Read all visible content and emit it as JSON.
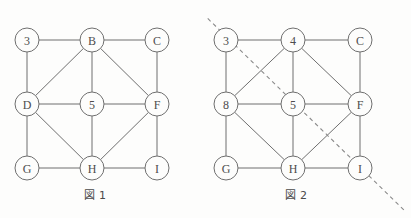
{
  "document": {
    "title": "Two isomorphic 3x3 grid graphs with diagonals",
    "background_color": "#fdfdfc",
    "line_color": "#6f6f6f",
    "label_color": "#4d4d4d",
    "dash_color": "#8a8a8a"
  },
  "figures": [
    {
      "id": "figure-1",
      "caption": "図 1",
      "geometry": {
        "columns_x": [
          27,
          92,
          157
        ],
        "rows_y": [
          40,
          104,
          168
        ],
        "node_radius": 12
      },
      "nodes": [
        {
          "id": "n1",
          "label": "3",
          "col": 0,
          "row": 0,
          "cx": 27,
          "cy": 40
        },
        {
          "id": "n2",
          "label": "B",
          "col": 1,
          "row": 0,
          "cx": 92,
          "cy": 40
        },
        {
          "id": "n3",
          "label": "C",
          "col": 2,
          "row": 0,
          "cx": 157,
          "cy": 40
        },
        {
          "id": "n4",
          "label": "D",
          "col": 0,
          "row": 1,
          "cx": 27,
          "cy": 104
        },
        {
          "id": "n5",
          "label": "5",
          "col": 1,
          "row": 1,
          "cx": 92,
          "cy": 104
        },
        {
          "id": "n6",
          "label": "F",
          "col": 2,
          "row": 1,
          "cx": 157,
          "cy": 104
        },
        {
          "id": "n7",
          "label": "G",
          "col": 0,
          "row": 2,
          "cx": 27,
          "cy": 168
        },
        {
          "id": "n8",
          "label": "H",
          "col": 1,
          "row": 2,
          "cx": 92,
          "cy": 168
        },
        {
          "id": "n9",
          "label": "I",
          "col": 2,
          "row": 2,
          "cx": 157,
          "cy": 168
        }
      ],
      "edges": [
        {
          "from": "n1",
          "to": "n2",
          "kind": "horizontal"
        },
        {
          "from": "n2",
          "to": "n3",
          "kind": "horizontal"
        },
        {
          "from": "n4",
          "to": "n5",
          "kind": "horizontal"
        },
        {
          "from": "n5",
          "to": "n6",
          "kind": "horizontal"
        },
        {
          "from": "n7",
          "to": "n8",
          "kind": "horizontal"
        },
        {
          "from": "n8",
          "to": "n9",
          "kind": "horizontal"
        },
        {
          "from": "n1",
          "to": "n4",
          "kind": "vertical"
        },
        {
          "from": "n2",
          "to": "n5",
          "kind": "vertical"
        },
        {
          "from": "n3",
          "to": "n6",
          "kind": "vertical"
        },
        {
          "from": "n4",
          "to": "n7",
          "kind": "vertical"
        },
        {
          "from": "n5",
          "to": "n8",
          "kind": "vertical"
        },
        {
          "from": "n6",
          "to": "n9",
          "kind": "vertical"
        },
        {
          "from": "n2",
          "to": "n4",
          "kind": "diagonal"
        },
        {
          "from": "n2",
          "to": "n6",
          "kind": "diagonal"
        },
        {
          "from": "n4",
          "to": "n8",
          "kind": "diagonal"
        },
        {
          "from": "n6",
          "to": "n8",
          "kind": "diagonal"
        }
      ],
      "cut_line": null
    },
    {
      "id": "figure-2",
      "caption": "図 2",
      "geometry": {
        "columns_x": [
          20,
          87,
          154
        ],
        "rows_y": [
          40,
          104,
          168
        ],
        "node_radius": 12
      },
      "nodes": [
        {
          "id": "m1",
          "label": "3",
          "col": 0,
          "row": 0,
          "cx": 20,
          "cy": 40
        },
        {
          "id": "m2",
          "label": "4",
          "col": 1,
          "row": 0,
          "cx": 87,
          "cy": 40
        },
        {
          "id": "m3",
          "label": "C",
          "col": 2,
          "row": 0,
          "cx": 154,
          "cy": 40
        },
        {
          "id": "m4",
          "label": "8",
          "col": 0,
          "row": 1,
          "cx": 20,
          "cy": 104
        },
        {
          "id": "m5",
          "label": "5",
          "col": 1,
          "row": 1,
          "cx": 87,
          "cy": 104
        },
        {
          "id": "m6",
          "label": "F",
          "col": 2,
          "row": 1,
          "cx": 154,
          "cy": 104
        },
        {
          "id": "m7",
          "label": "G",
          "col": 0,
          "row": 2,
          "cx": 20,
          "cy": 168
        },
        {
          "id": "m8",
          "label": "H",
          "col": 1,
          "row": 2,
          "cx": 87,
          "cy": 168
        },
        {
          "id": "m9",
          "label": "I",
          "col": 2,
          "row": 2,
          "cx": 154,
          "cy": 168
        }
      ],
      "edges": [
        {
          "from": "m1",
          "to": "m2",
          "kind": "horizontal"
        },
        {
          "from": "m2",
          "to": "m3",
          "kind": "horizontal"
        },
        {
          "from": "m4",
          "to": "m5",
          "kind": "horizontal"
        },
        {
          "from": "m5",
          "to": "m6",
          "kind": "horizontal"
        },
        {
          "from": "m7",
          "to": "m8",
          "kind": "horizontal"
        },
        {
          "from": "m8",
          "to": "m9",
          "kind": "horizontal"
        },
        {
          "from": "m1",
          "to": "m4",
          "kind": "vertical"
        },
        {
          "from": "m2",
          "to": "m5",
          "kind": "vertical"
        },
        {
          "from": "m3",
          "to": "m6",
          "kind": "vertical"
        },
        {
          "from": "m4",
          "to": "m7",
          "kind": "vertical"
        },
        {
          "from": "m5",
          "to": "m8",
          "kind": "vertical"
        },
        {
          "from": "m6",
          "to": "m9",
          "kind": "vertical"
        },
        {
          "from": "m2",
          "to": "m4",
          "kind": "diagonal"
        },
        {
          "from": "m2",
          "to": "m6",
          "kind": "diagonal"
        },
        {
          "from": "m4",
          "to": "m8",
          "kind": "diagonal"
        },
        {
          "from": "m6",
          "to": "m8",
          "kind": "diagonal"
        }
      ],
      "cut_line": {
        "style": "dashed",
        "x1": -9,
        "y1": 8,
        "x2": 200,
        "y2": 212
      }
    }
  ]
}
